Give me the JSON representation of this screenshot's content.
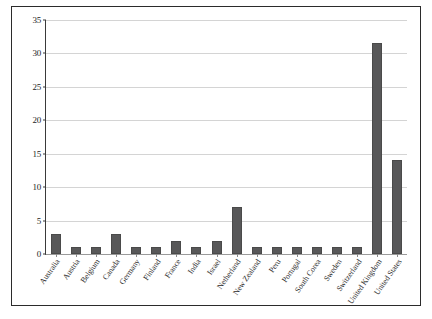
{
  "chart_data": {
    "type": "bar",
    "title": "",
    "subtitle": "",
    "xlabel": "",
    "ylabel": "",
    "ylim": [
      0,
      35
    ],
    "yticks": [
      0,
      5,
      10,
      15,
      20,
      25,
      30,
      35
    ],
    "grid": true,
    "legend": "none",
    "bar_color": "#585859",
    "gridline_color": "#d4d4d4",
    "categories": [
      "Australia",
      "Austria",
      "Belgium",
      "Canada",
      "Germany",
      "Finland",
      "France",
      "India",
      "Israel",
      "Netherland",
      "New Zealand",
      "Peru",
      "Portugal",
      "South Corea",
      "Sweden",
      "Switzerland",
      "United Kingdom",
      "United States"
    ],
    "values": [
      3,
      1,
      1,
      3,
      1,
      1,
      2,
      1,
      2,
      7,
      1,
      1,
      1,
      1,
      1,
      1,
      31.5,
      14
    ]
  }
}
